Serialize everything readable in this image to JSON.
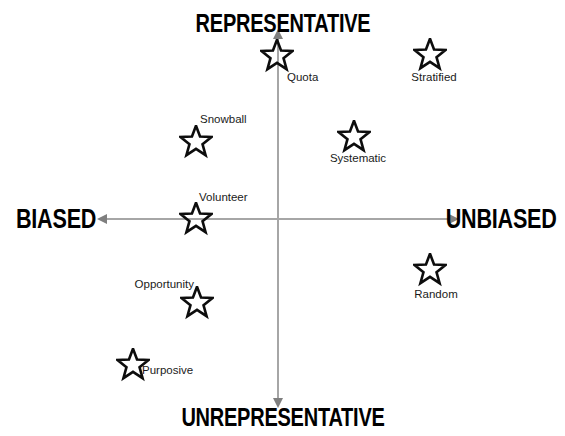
{
  "diagram": {
    "background_color": "#ffffff",
    "axis_color": "#a6a6a6",
    "label_color": "#1a1a1a",
    "pole_color": "#000000"
  },
  "axes": {
    "horizontal": {
      "left_label": "BIASED",
      "right_label": "UNBIASED"
    },
    "vertical": {
      "top_label": "REPRESENTATIVE",
      "bottom_label": "UNREPRESENTATIVE"
    }
  },
  "chart_data": {
    "type": "scatter",
    "title": "",
    "xlabel": "BIASED ↔ UNBIASED",
    "ylabel": "UNREPRESENTATIVE ↔ REPRESENTATIVE",
    "xlim": [
      -1,
      1
    ],
    "ylim": [
      -1,
      1
    ],
    "grid": false,
    "legend": "none",
    "marker": "star-outline",
    "origin_px": {
      "x": 278,
      "y": 219
    },
    "points": [
      {
        "name": "Quota",
        "x_px": 277,
        "y_px": 56,
        "label_pos": "bottom-right",
        "x": -0.01,
        "y": 0.9
      },
      {
        "name": "Stratified",
        "x_px": 430,
        "y_px": 55,
        "label_pos": "bottom",
        "x": 0.88,
        "y": 0.91
      },
      {
        "name": "Snowball",
        "x_px": 196,
        "y_px": 142,
        "label_pos": "top-right",
        "x": -0.47,
        "y": 0.43
      },
      {
        "name": "Systematic",
        "x_px": 354,
        "y_px": 137,
        "label_pos": "bottom",
        "x": 0.44,
        "y": 0.46
      },
      {
        "name": "Volunteer",
        "x_px": 196,
        "y_px": 219,
        "label_pos": "top-right",
        "x": -0.47,
        "y": 0.0
      },
      {
        "name": "Opportunity",
        "x_px": 197,
        "y_px": 303,
        "label_pos": "top-left",
        "x": -0.47,
        "y": -0.47
      },
      {
        "name": "Random",
        "x_px": 430,
        "y_px": 270,
        "label_pos": "bottom",
        "x": 0.88,
        "y": -0.28
      },
      {
        "name": "Purposive",
        "x_px": 133,
        "y_px": 365,
        "label_pos": "bottom-right",
        "x": -0.84,
        "y": -0.81
      }
    ]
  },
  "markers": {
    "quota": {
      "label": "Quota"
    },
    "stratified": {
      "label": "Stratified"
    },
    "snowball": {
      "label": "Snowball"
    },
    "systematic": {
      "label": "Systematic"
    },
    "volunteer": {
      "label": "Volunteer"
    },
    "opportunity": {
      "label": "Opportunity"
    },
    "random": {
      "label": "Random"
    },
    "purposive": {
      "label": "Purposive"
    }
  }
}
